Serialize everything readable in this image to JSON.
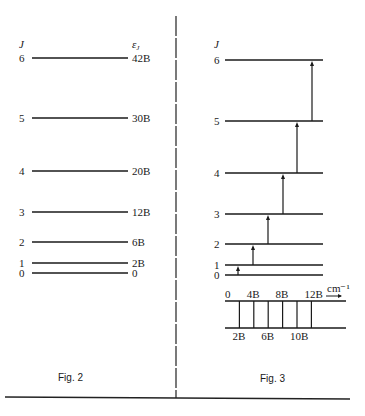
{
  "fig2": {
    "caption": "Fig. 2",
    "j_header": "J",
    "energy_header": "εJ",
    "levels": [
      {
        "j": "6",
        "energy": "42B",
        "y": 58
      },
      {
        "j": "5",
        "energy": "30B",
        "y": 118
      },
      {
        "j": "4",
        "energy": "20B",
        "y": 171
      },
      {
        "j": "3",
        "energy": "12B",
        "y": 212
      },
      {
        "j": "2",
        "energy": "6B",
        "y": 242
      },
      {
        "j": "1",
        "energy": "2B",
        "y": 263
      },
      {
        "j": "0",
        "energy": "0",
        "y": 273
      }
    ]
  },
  "fig3": {
    "caption": "Fig. 3",
    "j_header": "J",
    "levels": [
      {
        "j": "6",
        "y": 60
      },
      {
        "j": "5",
        "y": 121
      },
      {
        "j": "4",
        "y": 173
      },
      {
        "j": "3",
        "y": 214
      },
      {
        "j": "2",
        "y": 244
      },
      {
        "j": "1",
        "y": 265
      },
      {
        "j": "0",
        "y": 275
      }
    ],
    "transitions": [
      {
        "from": "0",
        "to": "1",
        "x": 238
      },
      {
        "from": "1",
        "to": "2",
        "x": 253
      },
      {
        "from": "2",
        "to": "3",
        "x": 268
      },
      {
        "from": "3",
        "to": "4",
        "x": 283
      },
      {
        "from": "4",
        "to": "5",
        "x": 297
      },
      {
        "from": "5",
        "to": "6",
        "x": 312
      }
    ],
    "spectrum": {
      "unit": "cm⁻¹",
      "top_labels": [
        "0",
        "4B",
        "8B",
        "12B"
      ],
      "bottom_labels": [
        "2B",
        "6B",
        "10B"
      ],
      "line_positions": [
        2,
        4,
        6,
        8,
        10,
        12
      ]
    }
  }
}
